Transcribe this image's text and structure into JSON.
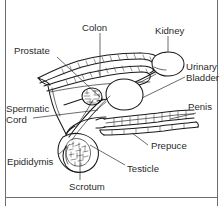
{
  "figure": {
    "type": "anatomical-line-diagram",
    "background_color": "#ffffff",
    "line_color": "#1a1a1a",
    "label_color": "#2b2b2b",
    "border_color": "#6e6e72"
  },
  "labels": [
    {
      "id": "colon",
      "text": "Colon"
    },
    {
      "id": "kidney",
      "text": "Kidney"
    },
    {
      "id": "prostate",
      "text": "Prostate"
    },
    {
      "id": "urinary-bladder",
      "text": "Urinary"
    },
    {
      "id": "urinary-bladder2",
      "text": "Bladder"
    },
    {
      "id": "spermatic-cord",
      "text": "Spermatic"
    },
    {
      "id": "spermatic-cord2",
      "text": "Cord"
    },
    {
      "id": "penis",
      "text": "Penis"
    },
    {
      "id": "prepuce",
      "text": "Prepuce"
    },
    {
      "id": "epididymis",
      "text": "Epididymis"
    },
    {
      "id": "testicle",
      "text": "Testicle"
    },
    {
      "id": "scrotum",
      "text": "Scrotum"
    }
  ],
  "structures": [
    {
      "id": "colon",
      "name": "colon"
    },
    {
      "id": "kidney",
      "name": "kidney"
    },
    {
      "id": "prostate",
      "name": "prostate-gland"
    },
    {
      "id": "urinary-bladder",
      "name": "urinary-bladder"
    },
    {
      "id": "spermatic-cord",
      "name": "spermatic-cord"
    },
    {
      "id": "penis",
      "name": "penis"
    },
    {
      "id": "prepuce",
      "name": "prepuce"
    },
    {
      "id": "epididymis",
      "name": "epididymis"
    },
    {
      "id": "testicle",
      "name": "testicle"
    },
    {
      "id": "scrotum",
      "name": "scrotum"
    }
  ]
}
